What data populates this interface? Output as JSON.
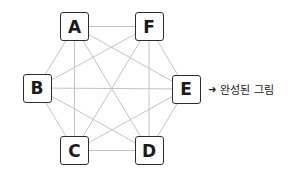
{
  "diagram": {
    "type": "complete-graph",
    "nodes": [
      {
        "id": "A",
        "label": "A",
        "cx": 74.5,
        "cy": 26.5
      },
      {
        "id": "F",
        "label": "F",
        "cx": 149,
        "cy": 26.5
      },
      {
        "id": "B",
        "label": "B",
        "cx": 37,
        "cy": 88
      },
      {
        "id": "E",
        "label": "E",
        "cx": 186,
        "cy": 89
      },
      {
        "id": "C",
        "label": "C",
        "cx": 74.5,
        "cy": 150.5
      },
      {
        "id": "D",
        "label": "D",
        "cx": 149,
        "cy": 150.5
      }
    ],
    "edges": [
      [
        "A",
        "F"
      ],
      [
        "A",
        "B"
      ],
      [
        "A",
        "E"
      ],
      [
        "A",
        "C"
      ],
      [
        "A",
        "D"
      ],
      [
        "F",
        "B"
      ],
      [
        "F",
        "E"
      ],
      [
        "F",
        "C"
      ],
      [
        "F",
        "D"
      ],
      [
        "B",
        "E"
      ],
      [
        "B",
        "C"
      ],
      [
        "B",
        "D"
      ],
      [
        "E",
        "C"
      ],
      [
        "E",
        "D"
      ],
      [
        "C",
        "D"
      ]
    ],
    "colors": {
      "edge": "#c4c4c4",
      "node_border": "#2e2e2e",
      "node_text": "#1a1a1a"
    }
  },
  "caption": {
    "arrow": "➜",
    "text": "완성된 그림"
  }
}
